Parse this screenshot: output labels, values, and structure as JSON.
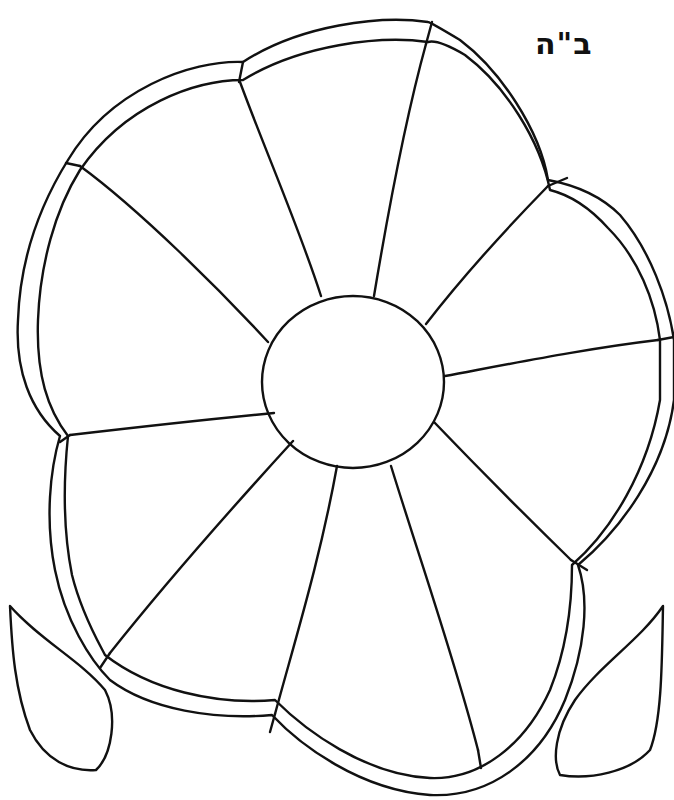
{
  "page": {
    "type": "coloring-page",
    "header_text": "ב\"ה",
    "colors": {
      "ink": "#111111",
      "paper": "#ffffff"
    }
  },
  "flower": {
    "center": {
      "cx": 353,
      "cy": 382,
      "rx": 91,
      "ry": 86
    },
    "petal_count": 5,
    "segment_count": 10
  },
  "leaves": [
    {
      "side": "left"
    },
    {
      "side": "right"
    }
  ]
}
